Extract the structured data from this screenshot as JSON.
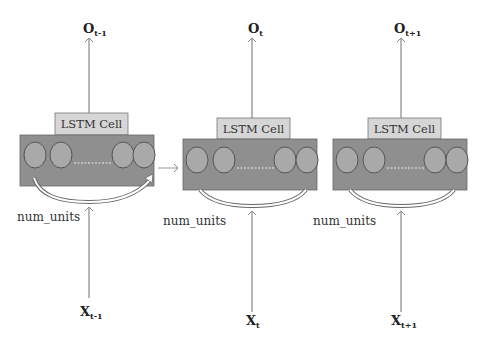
{
  "diagram": {
    "colors": {
      "cell_body": "#8f8f8f",
      "cell_label_box": "#d6d6d6",
      "unit_circle_fill": "#a9a9a9",
      "unit_circle_stroke": "#555555",
      "arrow": "#888888",
      "dashed_line": "#eeeeee"
    },
    "cells": [
      {
        "label": "LSTM Cell",
        "output": {
          "base": "O",
          "sub": "t-1"
        },
        "input": {
          "base": "X",
          "sub": "t-1"
        },
        "units_label": "num_units"
      },
      {
        "label": "LSTM Cell",
        "output": {
          "base": "O",
          "sub": "t"
        },
        "input": {
          "base": "X",
          "sub": "t"
        },
        "units_label": "num_units"
      },
      {
        "label": "LSTM Cell",
        "output": {
          "base": "O",
          "sub": "t+1"
        },
        "input": {
          "base": "X",
          "sub": "t+1"
        },
        "units_label": "num_units"
      }
    ],
    "edges": [
      {
        "from": "cell-1",
        "to": "cell-2",
        "type": "recurrent-state"
      }
    ]
  }
}
